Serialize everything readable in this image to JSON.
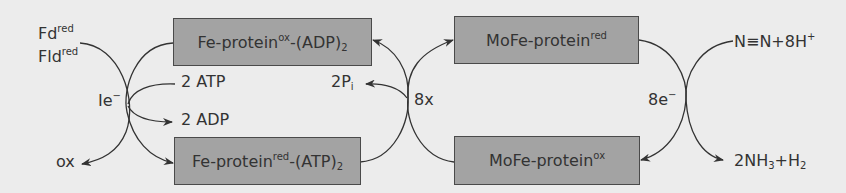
{
  "boxes": {
    "fe_ox": {
      "main": "Fe-protein",
      "sup": "ox",
      "tail": "-(ADP)",
      "sub": "2"
    },
    "fe_red": {
      "main": "Fe-protein",
      "sup": "red",
      "tail": "-(ATP)",
      "sub": "2"
    },
    "mofe_red": {
      "main": "MoFe-protein",
      "sup": "red"
    },
    "mofe_ox": {
      "main": "MoFe-protein",
      "sup": "ox"
    }
  },
  "labels": {
    "fd": {
      "main": "Fd",
      "sup": "red"
    },
    "fld": {
      "main": "Fld",
      "sup": "red"
    },
    "ox": "ox",
    "electron": {
      "main": "Ie",
      "sup": "−"
    },
    "atp": "2 ATP",
    "adp": "2 ADP",
    "pi": {
      "main": "2P",
      "sub": "i"
    },
    "times8": "8x",
    "eight_e": {
      "main": "8e",
      "sup": "−"
    },
    "n2": {
      "main": "N≡N+8H",
      "sup": "+"
    },
    "nh3": {
      "a": "2NH",
      "sub1": "3",
      "b": "+H",
      "sub2": "2"
    }
  },
  "colors": {
    "background": "#ececec",
    "box_fill": "#a3a3a3",
    "box_border": "#4a4a4a",
    "line": "#333333"
  }
}
